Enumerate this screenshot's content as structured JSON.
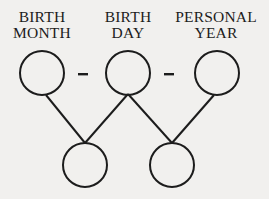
{
  "diagram": {
    "labels": [
      {
        "line1": "BIRTH",
        "line2": "MONTH"
      },
      {
        "line1": "BIRTH",
        "line2": "DAY"
      },
      {
        "line1": "PERSONAL",
        "line2": "YEAR"
      }
    ],
    "separators": [
      "–",
      "–"
    ],
    "top_circles": 3,
    "bottom_circles": 2,
    "stroke_color": "#1c1c1c",
    "background_color": "#f1f0ee"
  }
}
